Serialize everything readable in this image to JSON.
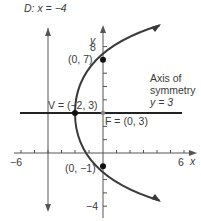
{
  "diagram": {
    "directrix_label": "D: x = −4",
    "y_axis_label": "y",
    "x_axis_label": "x",
    "x_ticks": {
      "min_label": "−6",
      "max_label": "6"
    },
    "y_ticks": {
      "top_label": "8",
      "bottom_label": "−4"
    },
    "axis_of_symmetry": {
      "line1": "Axis of",
      "line2": "symmetry",
      "line3": "y = 3"
    },
    "points": {
      "vertex": "V = (−2, 3)",
      "focus": "F = (0, 3)",
      "upper": "(0, 7)",
      "lower": "(0, −1)"
    },
    "colors": {
      "curve": "#3a3a3a",
      "axis": "#555555",
      "background": "#ffffff"
    }
  }
}
